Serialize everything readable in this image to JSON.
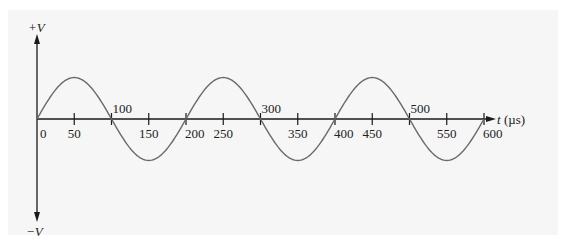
{
  "chart_data": {
    "type": "line",
    "title": "",
    "xlabel": "t (µs)",
    "ylabel": "",
    "y_top_label": "+V",
    "y_bottom_label": "−V",
    "x_ticks": [
      0,
      50,
      100,
      150,
      200,
      250,
      300,
      350,
      400,
      450,
      500,
      550,
      600
    ],
    "x_tick_labels": [
      "0",
      "50",
      "100",
      "150",
      "200",
      "250",
      "300",
      "350",
      "400",
      "450",
      "500",
      "550",
      "600"
    ],
    "xlim": [
      0,
      600
    ],
    "ylim": [
      -1,
      1
    ],
    "grid": false,
    "series": [
      {
        "name": "sine wave",
        "function": "V*sin(2*pi*t/200)",
        "period_us": 200,
        "amplitude": 1,
        "x": [
          0,
          50,
          100,
          150,
          200,
          250,
          300,
          350,
          400,
          450,
          500,
          550,
          600
        ],
        "values": [
          0,
          1,
          0,
          -1,
          0,
          1,
          0,
          -1,
          0,
          1,
          0,
          -1,
          0
        ]
      }
    ],
    "colors": {
      "curve": "#6a6a6a",
      "axis": "#1a1a1a"
    }
  }
}
